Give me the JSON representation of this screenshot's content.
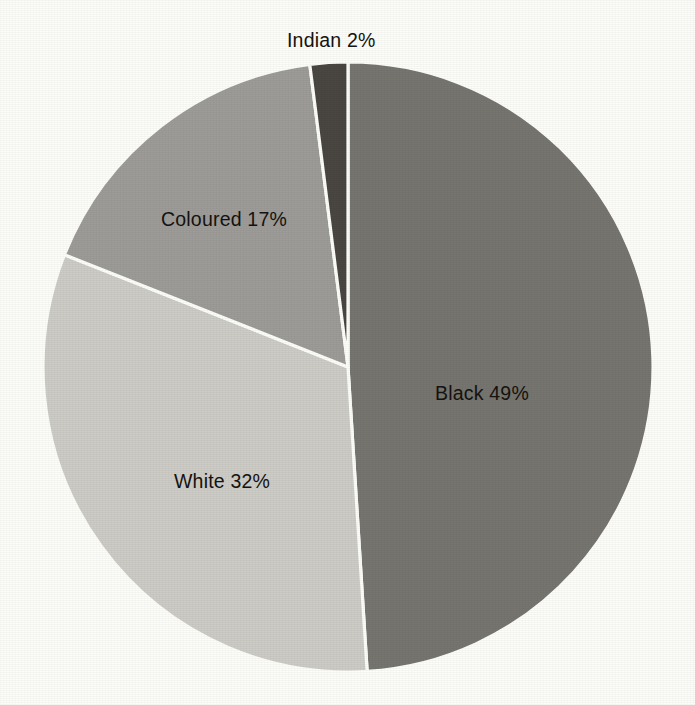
{
  "chart_data": {
    "type": "pie",
    "title": "",
    "subtitle": "",
    "xlabel": "",
    "ylabel": "",
    "legend": "none",
    "grid": false,
    "units": "percent",
    "categories": [
      "Black",
      "White",
      "Coloured",
      "Indian"
    ],
    "values": [
      49,
      32,
      17,
      2
    ],
    "slices": [
      {
        "name": "Black",
        "value": 49,
        "value_text": "49%",
        "label": "Black 49%",
        "color": "#777570",
        "start_angle_deg": 0,
        "sweep_angle_deg": 176.4
      },
      {
        "name": "White",
        "value": 32,
        "value_text": "32%",
        "label": "White 32%",
        "color": "#cdccc7",
        "start_angle_deg": 176.4,
        "sweep_angle_deg": 115.2
      },
      {
        "name": "Coloured",
        "value": 17,
        "value_text": "17%",
        "label": "Coloured 17%",
        "color": "#9d9c98",
        "start_angle_deg": 291.6,
        "sweep_angle_deg": 61.2
      },
      {
        "name": "Indian",
        "value": 2,
        "value_text": "2%",
        "label": "Indian 2%",
        "color": "#4a4642",
        "start_angle_deg": 352.8,
        "sweep_angle_deg": 7.2
      }
    ]
  },
  "labels": {
    "black": "Black 49%",
    "white": "White 32%",
    "coloured": "Coloured 17%",
    "indian": "Indian 2%"
  },
  "colors": {
    "background": "#fdfdf9",
    "separator": "#fdfdf9",
    "text": "#15120f",
    "black_slice": "#777570",
    "white_slice": "#cdccc7",
    "coloured_slice": "#9d9c98",
    "indian_slice": "#4a4642"
  },
  "geometry": {
    "center_x": 348,
    "center_y": 367,
    "radius": 305
  }
}
